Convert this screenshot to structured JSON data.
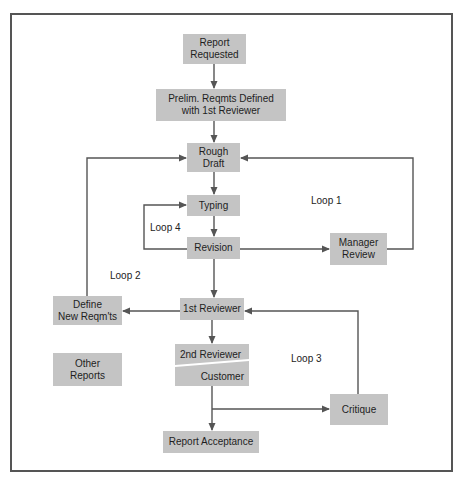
{
  "diagram": {
    "nodes": {
      "report_requested": "Report\nRequested",
      "prelim": "Prelim. Reqmts Defined\nwith 1st Reviewer",
      "rough_draft": "Rough\nDraft",
      "typing": "Typing",
      "revision": "Revision",
      "manager_review": "Manager\nReview",
      "define_new": "Define\nNew Reqm'ts",
      "first_reviewer": "1st Reviewer",
      "second_reviewer": "2nd Reviewer",
      "customer": "Customer",
      "other_reports": "Other\nReports",
      "critique": "Critique",
      "report_acceptance": "Report Acceptance"
    },
    "loops": {
      "loop1": "Loop 1",
      "loop2": "Loop 2",
      "loop3": "Loop 3",
      "loop4": "Loop 4"
    },
    "colors": {
      "box_fill": "#c4c4c4",
      "line": "#555555",
      "frame": "#555555"
    }
  }
}
